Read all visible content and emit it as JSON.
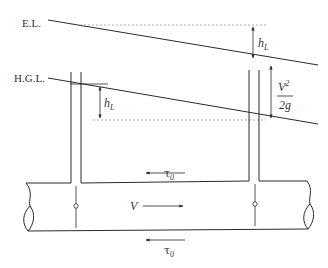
{
  "diagram": {
    "labels": {
      "energy_line": "E.L.",
      "hydraulic_grade_line": "H.G.L.",
      "head_loss_symbol": "h",
      "head_loss_subscript": "L",
      "velocity_head_numerator": "V",
      "velocity_head_exponent": "2",
      "velocity_head_denominator": "2g",
      "velocity": "V",
      "wall_shear_symbol": "τ",
      "wall_shear_subscript": "0"
    },
    "colors": {
      "line": "#2a2a2a",
      "dashed_reference": "#8a8a8a",
      "background": "#ffffff"
    }
  }
}
